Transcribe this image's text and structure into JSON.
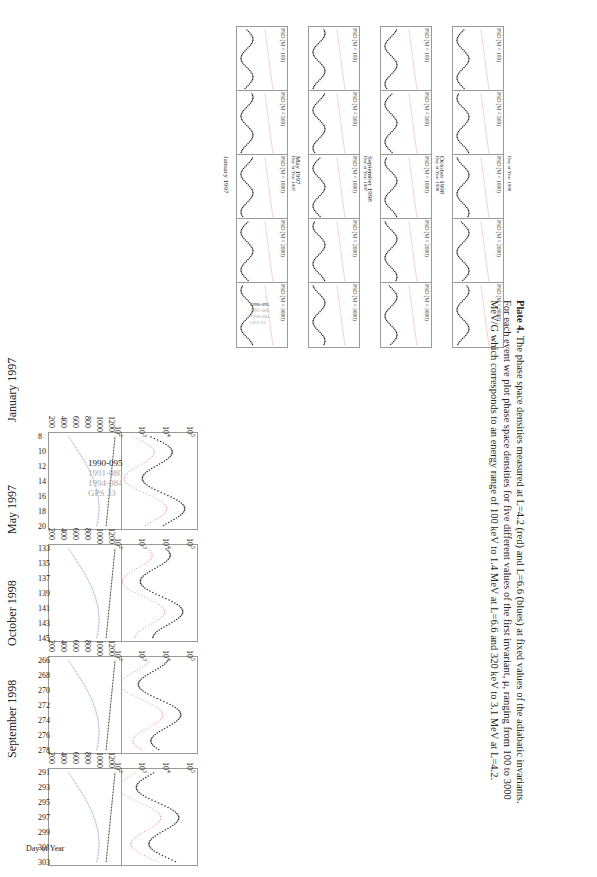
{
  "left_panels": [
    {
      "event": "January 1997",
      "c_ticks": [
        "10^5",
        "10^4",
        "10^3",
        "10^2"
      ],
      "e_ticks": [
        "1200",
        "1000",
        "800",
        "600",
        "400",
        "200"
      ],
      "x_ticks": [
        "8",
        "10",
        "12",
        "14",
        "16",
        "18",
        "20"
      ],
      "legend": [
        "1990-095",
        "1991-080",
        "1994-084",
        "GPS 33"
      ]
    },
    {
      "event": "May 1997",
      "c_ticks": [
        "10^5",
        "10^4",
        "10^3",
        "10^2"
      ],
      "e_ticks": [
        "1200",
        "1000",
        "800",
        "600",
        "400",
        "200"
      ],
      "x_ticks": [
        "133",
        "135",
        "137",
        "139",
        "141",
        "143",
        "145"
      ]
    },
    {
      "event": "October 1998",
      "c_ticks": [
        "10^5",
        "10^4",
        "10^3",
        "10^2"
      ],
      "e_ticks": [
        "1200",
        "1000",
        "800",
        "600",
        "400",
        "200"
      ],
      "x_ticks": [
        "266",
        "268",
        "270",
        "272",
        "274",
        "276",
        "278"
      ]
    },
    {
      "event": "September 1998",
      "c_ticks": [
        "10^5",
        "10^4",
        "10^3",
        "10^2"
      ],
      "e_ticks": [
        "1200",
        "1000",
        "800",
        "600",
        "400",
        "200"
      ],
      "x_ticks": [
        "291",
        "293",
        "295",
        "297",
        "299",
        "301",
        "303"
      ],
      "x_label": "Day of Year"
    }
  ],
  "left_axis_labels": {
    "c": "C",
    "e": "E_o"
  },
  "plate_columns": [
    {
      "title": "January 1997",
      "x_ticks": [
        "8",
        "10",
        "12",
        "14",
        "16",
        "18",
        "20"
      ],
      "x_label": "Day of Year 1997",
      "legend": [
        "1990-095",
        "1991-080",
        "1994-084",
        "GPS 33"
      ]
    },
    {
      "title": "May 1997",
      "x_ticks": [
        "133",
        "135",
        "137",
        "139",
        "141",
        "143",
        "145"
      ],
      "x_label": "Day of Year 1997"
    },
    {
      "title": "September 1998",
      "x_ticks": [
        "266",
        "268",
        "270",
        "272",
        "274",
        "276",
        "278"
      ],
      "x_label": "Day of Year 1998"
    },
    {
      "title": "October 1998",
      "x_ticks": [
        "291",
        "293",
        "295",
        "297",
        "299",
        "301",
        "303"
      ],
      "x_label": "Day of Year 1998"
    }
  ],
  "psd_rows": [
    {
      "label": "PSD (M = 100)",
      "ticks": [
        "1.000",
        "0.100",
        "0.010",
        "0.001"
      ]
    },
    {
      "label": "PSD (M = 500)",
      "ticks": [
        "10^-2",
        "10^-3",
        "10^-4",
        "10^-5"
      ]
    },
    {
      "label": "PSD (M = 1000)",
      "ticks": [
        "10^-3",
        "10^-4",
        "10^-5",
        "10^-6"
      ]
    },
    {
      "label": "PSD (M = 2000)",
      "ticks": [
        "10^-4",
        "10^-5",
        "10^-6",
        "10^-7",
        "10^-8"
      ]
    },
    {
      "label": "PSD (M = 3000)",
      "ticks": [
        "10^-4",
        "10^-5",
        "10^-6",
        "10^-7",
        "10^-8",
        "10^-9"
      ]
    }
  ],
  "caption": {
    "bold": "Plate 4.",
    "lines": [
      " The phase space densities measured at L=4.2 (red) and L=6.6 (blues) at fixed values of the adiabatic invariants.",
      "For each event we plot phase space densities for five different values of the first invariant, μ, ranging from 100 to 3000",
      "MeV/G which corresponds to an energy range of 100 keV to 1.4 MeV at L=6.6 and 320 keV to 3.1 MeV at L=4.2."
    ]
  },
  "colors": {
    "red_series": "#d9534f",
    "blue_series": "#3a6fb0",
    "frame": "#999999"
  }
}
